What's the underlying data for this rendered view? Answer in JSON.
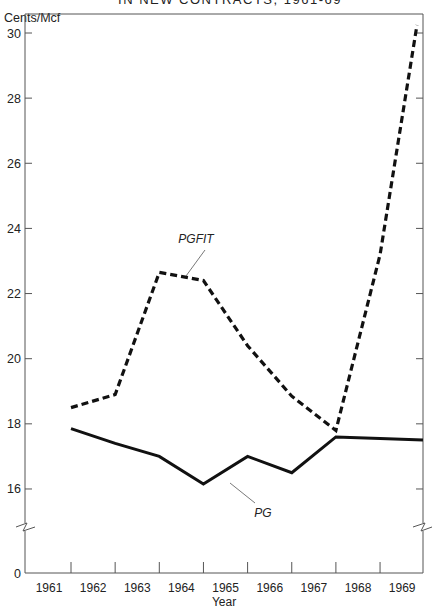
{
  "chart_data": {
    "type": "line",
    "title": "IN NEW CONTRACTS, 1961-69",
    "xlabel": "Year",
    "ylabel": "Cents/Mcf",
    "categories": [
      "1961",
      "1962",
      "1963",
      "1964",
      "1965",
      "1966",
      "1967",
      "1968",
      "1969"
    ],
    "series": [
      {
        "name": "PGFIT",
        "style": "dashed",
        "values": [
          18.5,
          18.9,
          22.65,
          22.4,
          20.4,
          18.85,
          17.8,
          23.2,
          30.25
        ]
      },
      {
        "name": "PG",
        "style": "solid",
        "values": [
          17.85,
          17.4,
          17.0,
          16.15,
          17.0,
          16.5,
          17.6,
          17.55,
          17.5
        ]
      }
    ],
    "yticks": [
      30,
      28,
      26,
      24,
      22,
      20,
      18,
      16,
      0
    ],
    "ylim": [
      15,
      30.5
    ],
    "axis_break": true,
    "grid": false,
    "legend": "inline labels with leader lines"
  },
  "labels": {
    "title": "IN NEW CONTRACTS, 1961-69",
    "y_unit": "Cents/Mcf",
    "x_title": "Year",
    "pgfit": "PGFIT",
    "pg": "PG"
  },
  "colors": {
    "line": "#111111",
    "axis": "#555555",
    "text": "#222222"
  }
}
